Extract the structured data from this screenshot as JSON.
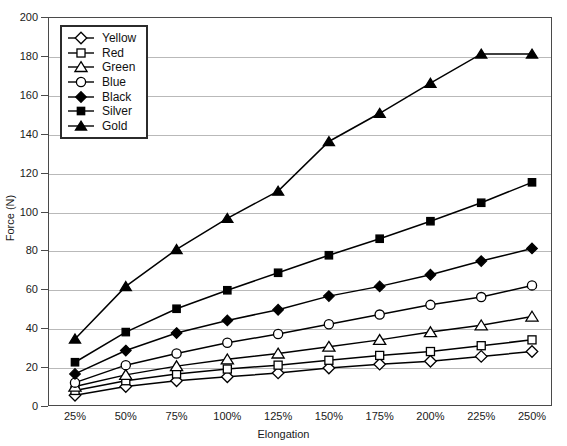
{
  "chart_data": {
    "type": "line",
    "title": "",
    "xlabel": "Elongation",
    "ylabel": "Force (N)",
    "categories": [
      "25%",
      "50%",
      "75%",
      "100%",
      "125%",
      "150%",
      "175%",
      "200%",
      "225%",
      "250%"
    ],
    "x_tick_labels": [
      "25%",
      "50%",
      "75%",
      "100%",
      "125%",
      "150%",
      "175%",
      "200%",
      "225%",
      "250%"
    ],
    "y_tick_labels": [
      "0",
      "20",
      "40",
      "60",
      "80",
      "100",
      "120",
      "140",
      "160",
      "180",
      "200"
    ],
    "ylim": [
      0,
      200
    ],
    "y_tick_step": 20,
    "grid": true,
    "legend_position": "top-left-inside",
    "series": [
      {
        "name": "Yellow",
        "marker": "open-diamond",
        "color": "#000000",
        "values": [
          5.5,
          10,
          13,
          15,
          17,
          19.5,
          21.5,
          23,
          25.5,
          28
        ]
      },
      {
        "name": "Red",
        "marker": "open-square",
        "color": "#000000",
        "values": [
          8,
          13,
          16.5,
          19,
          21,
          23.5,
          26,
          28,
          31,
          34
        ]
      },
      {
        "name": "Green",
        "marker": "open-triangle",
        "color": "#000000",
        "values": [
          10,
          16,
          20.5,
          24,
          27,
          30.5,
          34,
          38,
          41.5,
          46
        ]
      },
      {
        "name": "Blue",
        "marker": "open-circle",
        "color": "#000000",
        "values": [
          12,
          21,
          27,
          32.5,
          37,
          42,
          47,
          52,
          56,
          62
        ]
      },
      {
        "name": "Black",
        "marker": "filled-diamond",
        "color": "#000000",
        "values": [
          16.5,
          28.5,
          37.5,
          44,
          49.5,
          56.5,
          61.5,
          67.5,
          74.5,
          81
        ]
      },
      {
        "name": "Silver",
        "marker": "filled-square",
        "color": "#000000",
        "values": [
          22.5,
          38,
          50,
          59.5,
          68.5,
          77.5,
          86,
          95,
          104.5,
          115
        ]
      },
      {
        "name": "Gold",
        "marker": "filled-triangle",
        "color": "#000000",
        "values": [
          34.5,
          61.5,
          80.5,
          96.5,
          110.5,
          136,
          150.5,
          166,
          181,
          181
        ]
      }
    ]
  },
  "legend": {
    "items": [
      {
        "label": "Yellow"
      },
      {
        "label": "Red"
      },
      {
        "label": "Green"
      },
      {
        "label": "Blue"
      },
      {
        "label": "Black"
      },
      {
        "label": "Silver"
      },
      {
        "label": "Gold"
      }
    ]
  }
}
